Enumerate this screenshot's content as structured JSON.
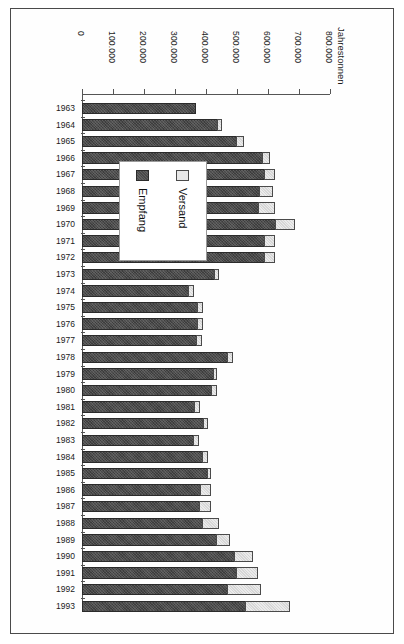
{
  "chart_data": {
    "type": "bar",
    "orientation": "horizontal",
    "stacked": true,
    "title": "",
    "xlabel": "Jahrestonnen",
    "ylabel": "",
    "xlim": [
      0,
      800000
    ],
    "xticks": [
      0,
      100000,
      200000,
      300000,
      400000,
      500000,
      600000,
      700000,
      800000
    ],
    "xtick_labels": [
      "0",
      "100.000",
      "200.000",
      "300.000",
      "400.000",
      "500.000",
      "600.000",
      "700.000",
      "800.000"
    ],
    "grid": false,
    "legend_position": "center-left-overlay",
    "categories": [
      "1963",
      "1964",
      "1965",
      "1966",
      "1967",
      "1968",
      "1969",
      "1970",
      "1971",
      "1972",
      "1973",
      "1974",
      "1975",
      "1976",
      "1977",
      "1978",
      "1979",
      "1980",
      "1981",
      "1982",
      "1983",
      "1984",
      "1985",
      "1986",
      "1987",
      "1988",
      "1989",
      "1990",
      "1991",
      "1992",
      "1993"
    ],
    "series": [
      {
        "name": "Empfang",
        "color": "#4a4a4a",
        "values": [
          368000,
          440000,
          500000,
          585000,
          590000,
          575000,
          570000,
          625000,
          590000,
          590000,
          430000,
          345000,
          375000,
          375000,
          370000,
          470000,
          425000,
          420000,
          365000,
          395000,
          360000,
          390000,
          405000,
          385000,
          380000,
          390000,
          435000,
          495000,
          500000,
          470000,
          530000
        ]
      },
      {
        "name": "Versand",
        "color": "#d6d6d6",
        "values": [
          0,
          15000,
          25000,
          25000,
          35000,
          45000,
          55000,
          65000,
          35000,
          35000,
          15000,
          20000,
          20000,
          20000,
          20000,
          20000,
          15000,
          20000,
          20000,
          15000,
          20000,
          20000,
          15000,
          35000,
          40000,
          55000,
          45000,
          60000,
          70000,
          110000,
          145000
        ]
      }
    ],
    "totals": [
      368000,
      455000,
      525000,
      610000,
      625000,
      620000,
      625000,
      690000,
      625000,
      625000,
      445000,
      365000,
      395000,
      395000,
      390000,
      490000,
      440000,
      440000,
      385000,
      410000,
      380000,
      410000,
      420000,
      420000,
      420000,
      445000,
      480000,
      555000,
      570000,
      580000,
      675000
    ],
    "legend": [
      {
        "label": "Empfang",
        "swatch": "dark"
      },
      {
        "label": "Versand",
        "swatch": "light"
      }
    ]
  }
}
